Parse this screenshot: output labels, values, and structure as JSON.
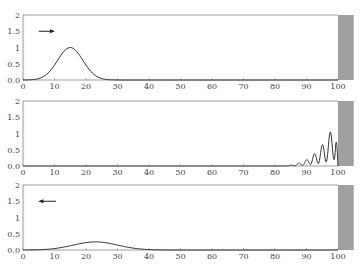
{
  "chart_data": [
    {
      "type": "line",
      "title": "",
      "xlabel": "",
      "ylabel": "",
      "xlim": [
        0,
        105
      ],
      "ylim": [
        0,
        2
      ],
      "x_ticks": [
        0,
        10,
        20,
        30,
        40,
        50,
        60,
        70,
        80,
        90,
        100
      ],
      "y_ticks": [
        "0.0",
        "0.5",
        "1",
        "1.5",
        "2"
      ],
      "grid": false,
      "annotations": [
        {
          "type": "arrow",
          "direction": "right",
          "x": [
            5,
            9.5
          ],
          "y": 1.5
        }
      ],
      "shaded_region": {
        "x": [
          100,
          105
        ],
        "color": "#a0a0a0"
      },
      "series": [
        {
          "name": "incident wave packet",
          "kind": "gaussian",
          "center": 15,
          "amplitude": 1.0,
          "width": 4,
          "x": [
            0,
            5,
            8,
            10,
            12,
            14,
            15,
            16,
            18,
            20,
            22,
            25,
            30
          ],
          "values": [
            0.0,
            0.04,
            0.24,
            0.46,
            0.75,
            0.97,
            1.0,
            0.97,
            0.75,
            0.46,
            0.24,
            0.04,
            0.0
          ]
        }
      ]
    },
    {
      "type": "line",
      "title": "",
      "xlabel": "",
      "ylabel": "",
      "xlim": [
        0,
        105
      ],
      "ylim": [
        0,
        2
      ],
      "x_ticks": [
        0,
        10,
        20,
        30,
        40,
        50,
        60,
        70,
        80,
        90,
        100
      ],
      "y_ticks": [
        "0.0",
        "0.5",
        "1",
        "1.5",
        "2"
      ],
      "grid": false,
      "shaded_region": {
        "x": [
          100,
          105
        ],
        "color": "#a0a0a0"
      },
      "series": [
        {
          "name": "interference at barrier",
          "kind": "oscillating",
          "x": [
            80,
            85,
            88,
            89,
            90,
            91,
            92.5,
            93.5,
            95,
            96,
            97,
            98,
            99,
            100
          ],
          "values": [
            0.0,
            0.03,
            0.1,
            0.18,
            0.3,
            0.12,
            0.7,
            0.15,
            1.2,
            0.1,
            1.5,
            0.05,
            1.5,
            0.0
          ]
        }
      ]
    },
    {
      "type": "line",
      "title": "",
      "xlabel": "",
      "ylabel": "",
      "xlim": [
        0,
        105
      ],
      "ylim": [
        0,
        2
      ],
      "x_ticks": [
        0,
        10,
        20,
        30,
        40,
        50,
        60,
        70,
        80,
        90,
        100
      ],
      "y_ticks": [
        "0.0",
        "0.5",
        "1",
        "1.5",
        "2"
      ],
      "grid": false,
      "annotations": [
        {
          "type": "arrow",
          "direction": "left",
          "x": [
            5.5,
            10.5
          ],
          "y": 1.5
        }
      ],
      "shaded_region": {
        "x": [
          100,
          105
        ],
        "color": "#a0a0a0"
      },
      "series": [
        {
          "name": "reflected wave packet",
          "kind": "gaussian",
          "center": 23,
          "amplitude": 0.25,
          "width": 7,
          "x": [
            0,
            5,
            10,
            15,
            20,
            23,
            26,
            30,
            35,
            40,
            45
          ],
          "values": [
            0.0,
            0.02,
            0.06,
            0.14,
            0.23,
            0.25,
            0.23,
            0.15,
            0.06,
            0.02,
            0.0
          ]
        }
      ]
    }
  ]
}
